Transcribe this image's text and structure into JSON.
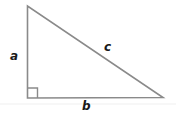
{
  "diagram": {
    "type": "right-triangle",
    "vertices": {
      "top": [
        27.5,
        6
      ],
      "right_angle": [
        27.5,
        98
      ],
      "bottom_right": [
        163,
        97.5
      ]
    },
    "right_angle_marker_size": 10,
    "stroke_color": "#8a8a8a",
    "baseline_color": "#eeeeee",
    "labels": {
      "a": "a",
      "b": "b",
      "c": "c"
    }
  }
}
